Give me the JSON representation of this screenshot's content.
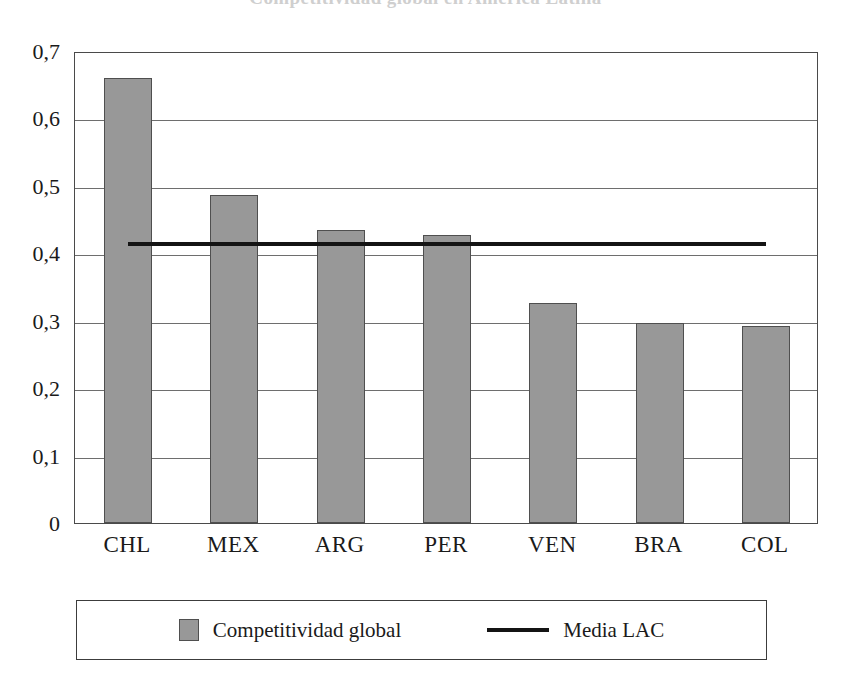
{
  "chart_data": {
    "type": "bar",
    "title": "Competitividad global en América Latina",
    "xlabel": "",
    "ylabel": "",
    "categories": [
      "CHL",
      "MEX",
      "ARG",
      "PER",
      "VEN",
      "BRA",
      "COL"
    ],
    "values": [
      0.66,
      0.487,
      0.434,
      0.427,
      0.327,
      0.297,
      0.292
    ],
    "series": [
      {
        "name": "Competitividad global",
        "type": "bar",
        "values": [
          0.66,
          0.487,
          0.434,
          0.427,
          0.327,
          0.297,
          0.292
        ],
        "color": "#989898"
      },
      {
        "name": "Media LAC",
        "type": "line",
        "value": 0.42,
        "color": "#141414"
      }
    ],
    "ylim": [
      0,
      0.7
    ],
    "ytick_values": [
      0,
      0.1,
      0.2,
      0.3,
      0.4,
      0.5,
      0.6,
      0.7
    ],
    "ytick_labels": [
      "0",
      "0,1",
      "0,2",
      "0,3",
      "0,4",
      "0,5",
      "0,6",
      "0,7"
    ],
    "grid": true,
    "grid_axis": "y",
    "legend_position": "bottom",
    "decimal_separator": ","
  },
  "legend": {
    "items": [
      {
        "label": "Competitividad global",
        "marker": "square-swatch-icon",
        "color": "#989898"
      },
      {
        "label": "Media LAC",
        "marker": "line-swatch-icon",
        "color": "#141414"
      }
    ]
  },
  "colors": {
    "bar_fill": "#989898",
    "bar_border": "#4f4f4f",
    "mean_line": "#141414",
    "grid": "#6e6e6e",
    "frame": "#4a4a4a",
    "background": "#ffffff"
  }
}
